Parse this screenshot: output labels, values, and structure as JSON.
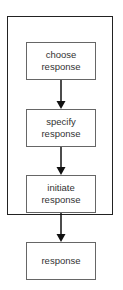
{
  "diagram": {
    "group_label": "",
    "nodes": [
      {
        "id": "choose",
        "label": "choose\nresponse"
      },
      {
        "id": "specify",
        "label": "specify\nresponse"
      },
      {
        "id": "initiate",
        "label": "initiate\nresponse"
      },
      {
        "id": "response",
        "label": "response"
      }
    ],
    "edges": [
      {
        "from": "choose",
        "to": "specify"
      },
      {
        "from": "specify",
        "to": "initiate"
      },
      {
        "from": "initiate",
        "to": "response"
      }
    ],
    "colors": {
      "border": "#222222",
      "box_border": "#666666",
      "text": "#333333"
    }
  }
}
